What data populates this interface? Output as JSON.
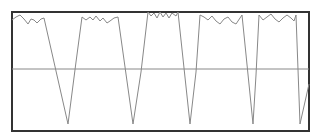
{
  "chart_data": {
    "type": "line",
    "title": "",
    "xlabel": "",
    "ylabel": "",
    "grid": false,
    "legend": null,
    "axis_ticks_visible": false,
    "frame": {
      "left": 12,
      "top": 12,
      "right": 309,
      "bottom": 131,
      "color": "#333333",
      "width": 2
    },
    "reference_line": {
      "y_px": 69,
      "color": "#888888"
    },
    "series": [
      {
        "name": "signal",
        "color": "#888888",
        "points_px": [
          [
            12,
            20
          ],
          [
            16,
            17
          ],
          [
            20,
            15
          ],
          [
            24,
            19
          ],
          [
            28,
            24
          ],
          [
            31,
            19
          ],
          [
            34,
            20
          ],
          [
            37,
            23
          ],
          [
            41,
            19
          ],
          [
            44,
            18
          ],
          [
            68,
            124
          ],
          [
            76,
            62
          ],
          [
            82,
            17
          ],
          [
            86,
            20
          ],
          [
            90,
            17
          ],
          [
            93,
            20
          ],
          [
            96,
            16
          ],
          [
            100,
            21
          ],
          [
            103,
            18
          ],
          [
            107,
            23
          ],
          [
            110,
            21
          ],
          [
            114,
            18
          ],
          [
            118,
            17
          ],
          [
            133,
            124
          ],
          [
            141,
            72
          ],
          [
            148,
            12
          ],
          [
            151,
            16
          ],
          [
            154,
            13
          ],
          [
            157,
            18
          ],
          [
            160,
            12
          ],
          [
            163,
            17
          ],
          [
            166,
            13
          ],
          [
            169,
            18
          ],
          [
            172,
            13
          ],
          [
            176,
            16
          ],
          [
            178,
            12
          ],
          [
            190,
            124
          ],
          [
            196,
            72
          ],
          [
            200,
            15
          ],
          [
            204,
            17
          ],
          [
            208,
            20
          ],
          [
            212,
            16
          ],
          [
            216,
            21
          ],
          [
            220,
            24
          ],
          [
            224,
            19
          ],
          [
            228,
            17
          ],
          [
            232,
            22
          ],
          [
            236,
            24
          ],
          [
            240,
            18
          ],
          [
            242,
            15
          ],
          [
            253,
            124
          ],
          [
            256,
            75
          ],
          [
            259,
            15
          ],
          [
            263,
            20
          ],
          [
            267,
            17
          ],
          [
            271,
            14
          ],
          [
            275,
            19
          ],
          [
            279,
            22
          ],
          [
            283,
            18
          ],
          [
            287,
            15
          ],
          [
            291,
            18
          ],
          [
            294,
            21
          ],
          [
            296,
            15
          ],
          [
            300,
            124
          ],
          [
            309,
            84
          ]
        ]
      }
    ],
    "troughs_x_px": [
      68,
      133,
      190,
      253,
      300
    ]
  }
}
